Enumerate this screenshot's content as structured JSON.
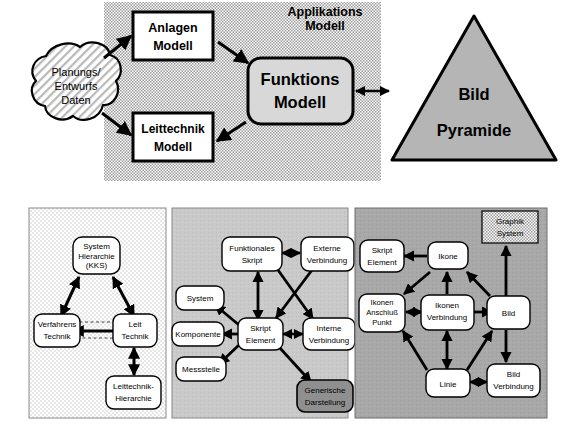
{
  "figure": {
    "title_upper": "Applikations Modell",
    "domain": "architecture-diagram"
  },
  "upper_diagram": {
    "container_label": "Applikations Modell",
    "container_label_line1": "Applikations",
    "container_label_line2": "Modell",
    "cloud": {
      "line1": "Planungs/",
      "line2": "Entwurfs",
      "line3": "Daten"
    },
    "boxes": [
      {
        "id": "anlagen",
        "line1": "Anlagen",
        "line2": "Modell"
      },
      {
        "id": "leittechnik",
        "line1": "Leittechnik",
        "line2": "Modell"
      },
      {
        "id": "funktions",
        "line1": "Funktions",
        "line2": "Modell"
      }
    ],
    "pyramid": {
      "line1": "Bild",
      "line2": "Pyramide"
    }
  },
  "panels": [
    {
      "id": "panel-1",
      "fill": "#ededed",
      "nodes": [
        {
          "id": "system-hierarchie",
          "lines": [
            "System",
            "Hierarchie",
            "(KKS)"
          ]
        },
        {
          "id": "verfahrens-technik",
          "lines": [
            "Verfahrens",
            "Technik"
          ]
        },
        {
          "id": "leit-technik",
          "lines": [
            "Leit",
            "Technik"
          ]
        },
        {
          "id": "leittechnik-hierarchie",
          "lines": [
            "Leittechnik-",
            "Hierarchie"
          ]
        }
      ]
    },
    {
      "id": "panel-2",
      "fill": "#c9c9c9",
      "nodes": [
        {
          "id": "funktionales-skript",
          "lines": [
            "Funktionales",
            "Skript"
          ]
        },
        {
          "id": "externe-verbindung",
          "lines": [
            "Externe",
            "Verbindung"
          ]
        },
        {
          "id": "system",
          "lines": [
            "System"
          ]
        },
        {
          "id": "komponente",
          "lines": [
            "Komponente"
          ]
        },
        {
          "id": "messstelle",
          "lines": [
            "Messstelle"
          ]
        },
        {
          "id": "skript-element",
          "lines": [
            "Skript",
            "Element"
          ]
        },
        {
          "id": "interne-verbindung",
          "lines": [
            "Interne",
            "Verbindung"
          ]
        },
        {
          "id": "generische-darstellung",
          "lines": [
            "Generische",
            "Darstellung"
          ]
        }
      ]
    },
    {
      "id": "panel-3",
      "fill": "#a8a8a8",
      "nodes": [
        {
          "id": "graphik-system",
          "lines": [
            "Graphik",
            "System"
          ]
        },
        {
          "id": "skript-element-3",
          "lines": [
            "Skript",
            "Element"
          ]
        },
        {
          "id": "ikone",
          "lines": [
            "Ikone"
          ]
        },
        {
          "id": "ikonen-anschluss-punkt",
          "lines": [
            "Ikonen",
            "Anschluß",
            "Punkt"
          ]
        },
        {
          "id": "ikonen-verbindung",
          "lines": [
            "Ikonen",
            "Verbindung"
          ]
        },
        {
          "id": "bild",
          "lines": [
            "Bild"
          ]
        },
        {
          "id": "linie",
          "lines": [
            "Linie"
          ]
        },
        {
          "id": "bild-verbindung",
          "lines": [
            "Bild",
            "Verbindung"
          ]
        }
      ]
    }
  ],
  "colors": {
    "ink": "#000000",
    "panel1_fill": "#ededed",
    "panel2_fill": "#c9c9c9",
    "panel3_fill": "#a8a8a8",
    "node_fill": "#ffffff",
    "accent_dark_node": "#8f8f8f",
    "funktions_fill": "#d8d8d8",
    "pyramid_fill": "#b5b5b5",
    "appl_container_fill": "#d5d5d5"
  }
}
